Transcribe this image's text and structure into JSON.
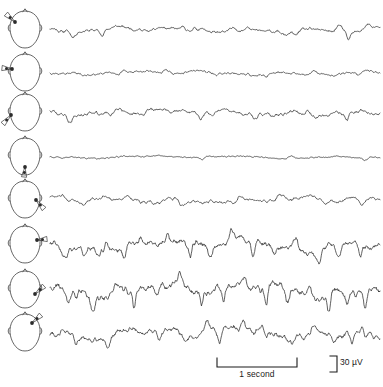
{
  "figure": {
    "type": "eeg-multichannel-recording",
    "background_color": "#ffffff",
    "trace_color": "#2b2b2b",
    "head_outline_color": "#4a4a4a",
    "channel_count": 8,
    "trace_left": 50,
    "trace_width": 330,
    "head_left": 2,
    "head_width": 46,
    "row_tops": [
      8,
      51,
      91,
      135,
      178,
      223,
      268,
      311
    ],
    "baseline_offset": 22
  },
  "scale_bars": {
    "time": {
      "label": "1 second",
      "length_px": 82,
      "left": 216,
      "top": 4
    },
    "amplitude": {
      "label": "30 µV",
      "height_px": 16,
      "left": 328,
      "top": 2
    }
  },
  "channels": [
    {
      "index": 1,
      "name": "channel-1",
      "electrode_marker": "left-frontal",
      "marker_x": 13,
      "marker_y": 14,
      "pointer": "up-left",
      "amplitude": 3.2,
      "seed": 11,
      "spikes": [
        [
          0.07,
          -5.0,
          0.012
        ],
        [
          0.155,
          -4.2,
          0.01
        ],
        [
          0.42,
          -4.6,
          0.011
        ],
        [
          0.6,
          3.4,
          0.012
        ],
        [
          0.745,
          -4.0,
          0.01
        ],
        [
          0.875,
          4.0,
          0.012
        ],
        [
          0.905,
          -8.0,
          0.01
        ],
        [
          0.965,
          4.2,
          0.011
        ]
      ],
      "freqs": [
        [
          5.0,
          1.0
        ],
        [
          9.0,
          0.62
        ],
        [
          14.5,
          0.4
        ],
        [
          22.0,
          0.22
        ],
        [
          31.0,
          0.12
        ]
      ],
      "activity": "low-amplitude-mixed-frequency"
    },
    {
      "index": 2,
      "name": "channel-2",
      "electrode_marker": "left-frontotemporal",
      "marker_x": 10,
      "marker_y": 18,
      "pointer": "left",
      "amplitude": 2.4,
      "seed": 27,
      "spikes": [
        [
          0.205,
          -3.4,
          0.011
        ],
        [
          0.35,
          3.4,
          0.012
        ],
        [
          0.505,
          -3.4,
          0.011
        ],
        [
          0.655,
          -3.0,
          0.01
        ],
        [
          0.8,
          3.0,
          0.012
        ],
        [
          0.935,
          -4.4,
          0.01
        ]
      ],
      "freqs": [
        [
          4.2,
          1.0
        ],
        [
          8.0,
          0.55
        ],
        [
          13.5,
          0.34
        ],
        [
          21.0,
          0.18
        ],
        [
          30.0,
          0.1
        ]
      ],
      "activity": "low-amplitude-mixed-frequency"
    },
    {
      "index": 3,
      "name": "channel-3",
      "electrode_marker": "left-posterior-temporal",
      "marker_x": 9,
      "marker_y": 24,
      "pointer": "down-left",
      "amplitude": 3.6,
      "seed": 43,
      "spikes": [
        [
          0.06,
          -5.2,
          0.011
        ],
        [
          0.185,
          -4.6,
          0.01
        ],
        [
          0.3,
          4.0,
          0.012
        ],
        [
          0.455,
          -4.8,
          0.011
        ],
        [
          0.62,
          -4.2,
          0.01
        ],
        [
          0.78,
          4.2,
          0.012
        ],
        [
          0.9,
          -5.4,
          0.01
        ]
      ],
      "freqs": [
        [
          5.5,
          1.0
        ],
        [
          9.5,
          0.66
        ],
        [
          15.0,
          0.42
        ],
        [
          23.0,
          0.24
        ],
        [
          32.0,
          0.14
        ]
      ],
      "activity": "low-amplitude-mixed-frequency"
    },
    {
      "index": 4,
      "name": "channel-4",
      "electrode_marker": "midline-vertex",
      "marker_x": 23,
      "marker_y": 32,
      "pointer": "down",
      "amplitude": 1.5,
      "seed": 59,
      "spikes": [
        [
          0.46,
          -2.6,
          0.01
        ],
        [
          0.73,
          2.2,
          0.011
        ],
        [
          0.955,
          -3.0,
          0.01
        ]
      ],
      "freqs": [
        [
          3.5,
          1.0
        ],
        [
          7.5,
          0.4
        ],
        [
          12.5,
          0.22
        ],
        [
          20.0,
          0.12
        ],
        [
          29.0,
          0.07
        ]
      ],
      "activity": "very-low-amplitude-attenuated"
    },
    {
      "index": 5,
      "name": "channel-5",
      "electrode_marker": "right-temporal",
      "marker_x": 34,
      "marker_y": 22,
      "pointer": "down-right",
      "amplitude": 3.4,
      "seed": 73,
      "spikes": [
        [
          0.1,
          -4.6,
          0.011
        ],
        [
          0.235,
          3.8,
          0.012
        ],
        [
          0.4,
          -5.0,
          0.011
        ],
        [
          0.56,
          -4.2,
          0.01
        ],
        [
          0.695,
          4.0,
          0.012
        ],
        [
          0.835,
          -4.8,
          0.01
        ],
        [
          0.945,
          -5.6,
          0.011
        ]
      ],
      "freqs": [
        [
          5.2,
          1.0
        ],
        [
          9.2,
          0.64
        ],
        [
          14.8,
          0.44
        ],
        [
          22.5,
          0.26
        ],
        [
          31.5,
          0.15
        ]
      ],
      "activity": "low-amplitude-mixed-frequency"
    },
    {
      "index": 6,
      "name": "channel-6",
      "electrode_marker": "right-frontotemporal",
      "marker_x": 35,
      "marker_y": 17,
      "pointer": "right",
      "amplitude": 6.5,
      "seed": 91,
      "spikes": [
        [
          0.045,
          -10.0,
          0.009
        ],
        [
          0.105,
          -9.0,
          0.009
        ],
        [
          0.17,
          7.5,
          0.01
        ],
        [
          0.225,
          -11.0,
          0.009
        ],
        [
          0.29,
          -8.5,
          0.009
        ],
        [
          0.355,
          8.0,
          0.01
        ],
        [
          0.425,
          -12.0,
          0.008
        ],
        [
          0.485,
          -9.5,
          0.009
        ],
        [
          0.55,
          8.5,
          0.01
        ],
        [
          0.615,
          -13.0,
          0.008
        ],
        [
          0.68,
          -9.0,
          0.009
        ],
        [
          0.745,
          8.0,
          0.01
        ],
        [
          0.815,
          -11.0,
          0.009
        ],
        [
          0.875,
          -8.0,
          0.009
        ],
        [
          0.94,
          -12.5,
          0.008
        ]
      ],
      "freqs": [
        [
          3.2,
          1.0
        ],
        [
          6.5,
          0.7
        ],
        [
          11.0,
          0.5
        ],
        [
          18.0,
          0.3
        ],
        [
          26.0,
          0.18
        ]
      ],
      "activity": "rhythmic-sharp-wave-activity"
    },
    {
      "index": 7,
      "name": "channel-7",
      "electrode_marker": "right-posterior",
      "marker_x": 33,
      "marker_y": 26,
      "pointer": "up-right",
      "amplitude": 7.5,
      "seed": 107,
      "spikes": [
        [
          0.055,
          -11.0,
          0.008
        ],
        [
          0.13,
          -13.0,
          0.008
        ],
        [
          0.195,
          9.0,
          0.009
        ],
        [
          0.255,
          -15.0,
          0.007
        ],
        [
          0.325,
          -10.0,
          0.008
        ],
        [
          0.395,
          9.5,
          0.009
        ],
        [
          0.46,
          -14.0,
          0.007
        ],
        [
          0.525,
          -11.0,
          0.008
        ],
        [
          0.59,
          10.0,
          0.009
        ],
        [
          0.655,
          -16.0,
          0.007
        ],
        [
          0.72,
          -11.5,
          0.008
        ],
        [
          0.785,
          9.0,
          0.009
        ],
        [
          0.845,
          -14.5,
          0.007
        ],
        [
          0.9,
          -12.0,
          0.008
        ],
        [
          0.955,
          -17.0,
          0.007
        ]
      ],
      "freqs": [
        [
          3.0,
          1.0
        ],
        [
          6.0,
          0.72
        ],
        [
          10.5,
          0.55
        ],
        [
          17.0,
          0.34
        ],
        [
          25.0,
          0.2
        ]
      ],
      "activity": "high-amplitude-spike-and-slow-wave"
    },
    {
      "index": 8,
      "name": "channel-8",
      "electrode_marker": "occipital",
      "marker_x": 30,
      "marker_y": 12,
      "pointer": "up-right",
      "amplitude": 6.0,
      "seed": 127,
      "spikes": [
        [
          0.08,
          -8.0,
          0.009
        ],
        [
          0.175,
          -7.0,
          0.009
        ],
        [
          0.25,
          6.5,
          0.01
        ],
        [
          0.33,
          -9.0,
          0.008
        ],
        [
          0.41,
          -7.5,
          0.009
        ],
        [
          0.475,
          11.0,
          0.009
        ],
        [
          0.515,
          -12.0,
          0.008
        ],
        [
          0.585,
          9.0,
          0.01
        ],
        [
          0.655,
          -8.0,
          0.009
        ],
        [
          0.735,
          -7.0,
          0.009
        ],
        [
          0.8,
          7.0,
          0.01
        ],
        [
          0.86,
          -9.5,
          0.008
        ],
        [
          0.915,
          -13.0,
          0.008
        ],
        [
          0.945,
          10.0,
          0.009
        ]
      ],
      "freqs": [
        [
          3.4,
          1.0
        ],
        [
          6.8,
          0.68
        ],
        [
          11.5,
          0.48
        ],
        [
          18.5,
          0.3
        ],
        [
          27.0,
          0.17
        ]
      ],
      "activity": "high-amplitude-irregular-sharp-waves"
    }
  ]
}
